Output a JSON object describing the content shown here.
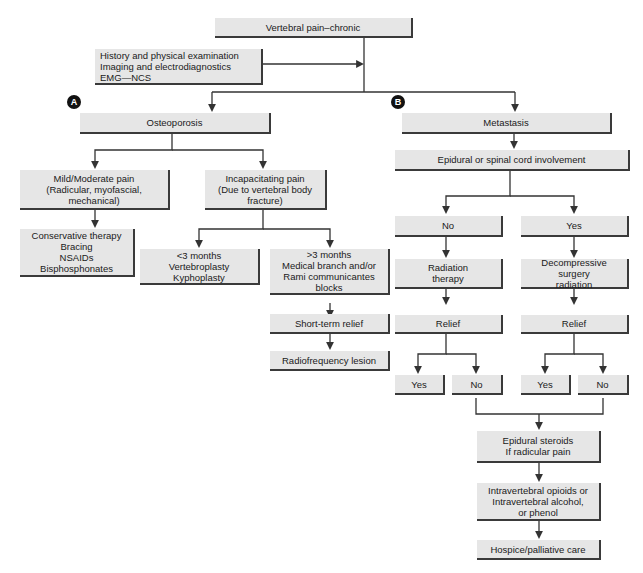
{
  "root": "Vertebral pain–chronic",
  "workup": "History and physical examination\nImaging and electrodiagnostics\nEMG—NCS",
  "branch_a": {
    "badge": "A",
    "title": "Osteoporosis",
    "mild": "Mild/Moderate pain\n(Radicular, myofascial,\nmechanical)",
    "mild_tx": "Conservative therapy\nBracing\nNSAIDs\nBisphosphonates",
    "incap": "Incapacitating pain\n(Due to vertebral body\nfracture)",
    "lt3": "<3 months\nVertebroplasty\nKyphoplasty",
    "gt3": ">3 months\nMedical branch and/or\nRami communicantes\nblocks",
    "short_relief": "Short-term relief",
    "rf": "Radiofrequency lesion"
  },
  "branch_b": {
    "badge": "B",
    "title": "Metastasis",
    "epidural": "Epidural or spinal cord involvement",
    "no": "No",
    "yes": "Yes",
    "radiation": "Radiation\ntherapy",
    "decompress": "Decompressive\nsurgery\nradiation",
    "relief1": "Relief",
    "relief2": "Relief",
    "r1_yes": "Yes",
    "r1_no": "No",
    "r2_yes": "Yes",
    "r2_no": "No",
    "steroids": "Epidural steroids\nIf radicular pain",
    "intrav": "Intravertebral opioids or\nIntravertebral alcohol,\nor phenol",
    "hospice": "Hospice/palliative care"
  }
}
